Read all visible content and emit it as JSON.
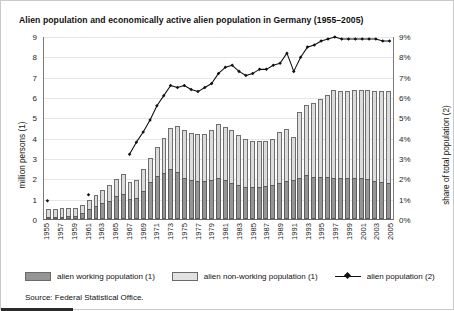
{
  "chart_title": "Alien population and economically active alien population in Germany (1955–2005)",
  "axes": {
    "left_label": "million persons (1)",
    "right_label": "share of total population (2)",
    "left_ticks": [
      "0",
      "1",
      "2",
      "3",
      "4",
      "5",
      "6",
      "7",
      "8",
      "9"
    ],
    "right_ticks": [
      "0%",
      "1%",
      "2%",
      "3%",
      "4%",
      "5%",
      "6%",
      "7%",
      "8%",
      "9%"
    ]
  },
  "legend": {
    "items": [
      {
        "key": "working",
        "label": "alien working population (1)",
        "color": "#959595",
        "marker": "swatch"
      },
      {
        "key": "nonworking",
        "label": "alien non-working population (1)",
        "color": "#e2e2e2",
        "marker": "swatch"
      },
      {
        "key": "share",
        "label": "alien population (2)",
        "color": "#111111",
        "marker": "line-diamond"
      }
    ]
  },
  "source": "Source: Federal Statistical Office.",
  "chart_data": {
    "type": "bar",
    "title": "Alien population and economically active alien population in Germany (1955–2005)",
    "xlabel": "",
    "ylabel": "million persons (1)",
    "ylabel_secondary": "share of total population (2)",
    "ylim": [
      0,
      9
    ],
    "ylim_secondary": [
      0,
      9
    ],
    "grid": true,
    "legend_position": "bottom",
    "stacked": true,
    "x": [
      1955,
      1956,
      1957,
      1958,
      1959,
      1960,
      1961,
      1962,
      1963,
      1964,
      1965,
      1966,
      1967,
      1968,
      1969,
      1970,
      1971,
      1972,
      1973,
      1974,
      1975,
      1976,
      1977,
      1978,
      1979,
      1980,
      1981,
      1982,
      1983,
      1984,
      1985,
      1986,
      1987,
      1988,
      1989,
      1990,
      1991,
      1992,
      1993,
      1994,
      1995,
      1996,
      1997,
      1998,
      1999,
      2000,
      2001,
      2002,
      2003,
      2004,
      2005
    ],
    "tick_labels": [
      "1955",
      "1957",
      "1959",
      "1961",
      "1963",
      "1965",
      "1967",
      "1969",
      "1971",
      "1973",
      "1975",
      "1977",
      "1979",
      "1981",
      "1983",
      "1985",
      "1987",
      "1989",
      "1991",
      "1993",
      "1995",
      "1997",
      "1999",
      "2001",
      "2003",
      "2005"
    ],
    "tick_every": 2,
    "series": [
      {
        "name": "alien working population (1)",
        "axis": "left",
        "color": "#959595",
        "values": [
          0.08,
          0.1,
          0.12,
          0.13,
          0.17,
          0.28,
          0.5,
          0.63,
          0.77,
          0.9,
          1.12,
          1.24,
          0.99,
          1.02,
          1.37,
          1.81,
          2.13,
          2.28,
          2.45,
          2.29,
          2.04,
          1.92,
          1.87,
          1.86,
          1.92,
          2.02,
          1.91,
          1.79,
          1.69,
          1.59,
          1.56,
          1.59,
          1.61,
          1.65,
          1.77,
          1.86,
          1.91,
          2.03,
          2.15,
          2.09,
          2.07,
          2.06,
          2.04,
          2.03,
          2.02,
          2.02,
          2.01,
          1.99,
          1.88,
          1.82,
          1.78
        ]
      },
      {
        "name": "alien non-working population (1)",
        "axis": "left",
        "color": "#dcdcdc",
        "values": [
          0.41,
          0.41,
          0.4,
          0.39,
          0.38,
          0.4,
          0.45,
          0.56,
          0.65,
          0.76,
          0.86,
          0.95,
          0.81,
          0.88,
          1.07,
          1.17,
          1.42,
          1.71,
          2.05,
          2.28,
          2.33,
          2.33,
          2.32,
          2.34,
          2.44,
          2.65,
          2.64,
          2.6,
          2.45,
          2.34,
          2.26,
          2.27,
          2.21,
          2.27,
          2.53,
          2.59,
          2.12,
          3.23,
          3.47,
          3.63,
          3.82,
          4.05,
          4.32,
          4.28,
          4.3,
          4.34,
          4.36,
          4.38,
          4.44,
          4.48,
          4.51
        ]
      },
      {
        "name": "alien population (2)",
        "axis": "right",
        "type": "line",
        "color": "#111111",
        "marker": "diamond",
        "values": [
          0.9,
          null,
          null,
          null,
          null,
          null,
          1.2,
          null,
          null,
          null,
          null,
          null,
          3.2,
          3.8,
          4.3,
          4.9,
          5.6,
          6.1,
          6.6,
          6.5,
          6.6,
          6.4,
          6.3,
          6.5,
          6.7,
          7.2,
          7.5,
          7.6,
          7.3,
          7.1,
          7.2,
          7.4,
          7.4,
          7.6,
          7.7,
          8.2,
          7.3,
          8.0,
          8.5,
          8.6,
          8.8,
          8.9,
          9.0,
          8.9,
          8.9,
          8.9,
          8.9,
          8.9,
          8.9,
          8.8,
          8.8
        ]
      }
    ]
  }
}
